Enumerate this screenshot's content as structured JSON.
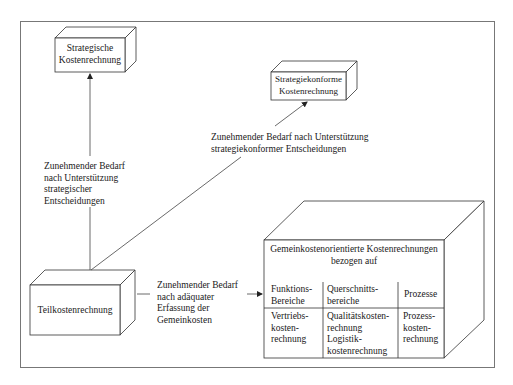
{
  "diagram": {
    "boxes": {
      "strategic": {
        "line1": "Strategische",
        "line2": "Kostenrechnung"
      },
      "strategy_conform": {
        "line1": "Strategiekonforme",
        "line2": "Kostenrechnung"
      },
      "partial_cost": {
        "label": "Teilkostenrechnung"
      },
      "overhead": {
        "title_line1": "Gemeinkostenorientierte Kostenrechnungen",
        "title_line2": "bezogen auf",
        "columns": [
          {
            "header_line1": "Funktions-",
            "header_line2": "Bereiche",
            "body": [
              "Vertriebs-",
              "kosten-",
              "rechnung"
            ]
          },
          {
            "header_line1": "Querschnitts-",
            "header_line2": "bereiche",
            "body": [
              "Qualitätskosten-",
              "rechnung",
              "Logistik-",
              "kostenrechnung"
            ]
          },
          {
            "header_line1": "Prozesse",
            "header_line2": "",
            "body": [
              "Prozess-",
              "kosten-",
              "rechnung"
            ]
          }
        ]
      }
    },
    "arrows": {
      "to_strategic": [
        "Zunehmender Bedarf",
        "nach Unterstützung",
        "strategischer",
        "Entscheidungen"
      ],
      "to_strategy_conform": [
        "Zunehmender Bedarf nach Unterstützung",
        "strategiekonformer Entscheidungen"
      ],
      "to_overhead": [
        "Zunehmender Bedarf",
        "nach adäquater",
        "Erfassung der",
        "Gemeinkosten"
      ]
    },
    "colors": {
      "line": "#333333",
      "frame": "#666666",
      "background": "#ffffff"
    }
  }
}
